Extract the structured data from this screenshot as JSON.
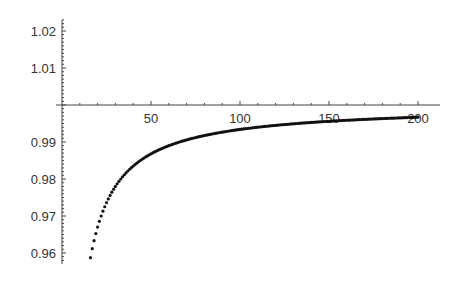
{
  "chart_data": {
    "type": "scatter",
    "title": "",
    "xlabel": "",
    "ylabel": "",
    "x_ticks": [
      50,
      100,
      150,
      200
    ],
    "y_ticks": [
      0.96,
      0.97,
      0.98,
      0.99,
      1.01,
      1.02
    ],
    "xlim": [
      0,
      200
    ],
    "ylim": [
      0.958,
      1.023
    ],
    "axis_origin": [
      0,
      1.0
    ],
    "grid": false,
    "legend": null,
    "series": [
      {
        "name": "f(n)",
        "description": "points approx 1 - 0.66/n for integer n from 16 to 200",
        "x_start": 16,
        "x_end": 200,
        "sample_points": [
          [
            16,
            0.959
          ],
          [
            20,
            0.967
          ],
          [
            30,
            0.978
          ],
          [
            50,
            0.987
          ],
          [
            100,
            0.9934
          ],
          [
            150,
            0.9956
          ],
          [
            200,
            0.9967
          ]
        ]
      }
    ],
    "color": "#111111"
  }
}
